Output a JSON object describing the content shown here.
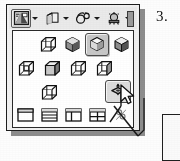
{
  "figure": {
    "step_number": "3.",
    "type": "cad-toolbar-flyout-screenshot"
  },
  "colors": {
    "window_bg": "#f2f1ef",
    "toolbar_bg": "#eceae6",
    "panel_bg": "#fffffe",
    "border": "#1d1d1d",
    "shadow": "#8d8d8d",
    "selected_fill": "#c9c7c3",
    "hover_fill": "#dedcd8",
    "ink": "#111111"
  },
  "toolbar": {
    "name": "view-toolbar",
    "buttons": [
      {
        "icon": "visual-style-icon",
        "label": "Visual Styles",
        "has_dropdown": true,
        "state": "pressed"
      },
      {
        "icon": "3d-views-cube-icon",
        "label": "3D Views",
        "has_dropdown": true,
        "state": "normal"
      },
      {
        "icon": "3d-orbit-icon",
        "label": "3D Orbit",
        "has_dropdown": true,
        "state": "normal"
      },
      {
        "icon": "lighting-sun-icon",
        "label": "Lights",
        "has_dropdown": true,
        "state": "normal"
      }
    ],
    "scrollbar": {
      "name": "toolbar-overflow-handle"
    }
  },
  "flyout": {
    "name": "visual-styles-flyout",
    "rows": [
      {
        "name": "row-shaded-styles",
        "items": [
          {
            "icon": "wireframe-cube-icon",
            "label": "3D Wireframe",
            "state": "normal"
          },
          {
            "icon": "shaded-cube-dark-icon",
            "label": "Conceptual",
            "state": "normal"
          },
          {
            "icon": "shaded-cube-edges-icon",
            "label": "Realistic",
            "state": "selected"
          },
          {
            "icon": "shaded-cube-plain-icon",
            "label": "Shaded",
            "state": "normal"
          }
        ]
      },
      {
        "name": "row-wireframe-styles",
        "items": [
          {
            "icon": "hidden-line-cube-icon",
            "label": "Hidden",
            "state": "normal"
          },
          {
            "icon": "flat-shaded-cube-icon",
            "label": "Flat Shaded",
            "state": "normal"
          },
          {
            "icon": "wireframe-cube-2-icon",
            "label": "2D Wireframe",
            "state": "normal"
          },
          {
            "icon": "wireframe-cube-3-icon",
            "label": "Gouraud Shaded",
            "state": "normal"
          }
        ]
      },
      {
        "name": "row-single-style",
        "items": [
          {
            "icon": "wireframe-cube-4-icon",
            "label": "Wireframe",
            "state": "normal"
          },
          {
            "icon": "ucs-align-plane-icon",
            "label": "3D Align / UCS",
            "state": "hover"
          }
        ]
      },
      {
        "name": "row-viewport-configs",
        "items": [
          {
            "icon": "viewport-single-icon",
            "label": "Single Viewport",
            "state": "normal"
          },
          {
            "icon": "viewport-three-horizontal-icon",
            "label": "Three: Horizontal",
            "state": "normal"
          },
          {
            "icon": "viewport-two-vertical-icon",
            "label": "Two: Vertical",
            "state": "normal"
          },
          {
            "icon": "viewport-four-equal-icon",
            "label": "Four: Equal",
            "state": "normal"
          },
          {
            "icon": "named-viewports-icon",
            "label": "Named Viewports",
            "state": "normal"
          }
        ]
      }
    ]
  },
  "cursor": {
    "name": "mouse-pointer",
    "kind": "arrow",
    "x": 124,
    "y": 86
  },
  "secondary_panel": {
    "name": "adjacent-dialog-edge"
  }
}
